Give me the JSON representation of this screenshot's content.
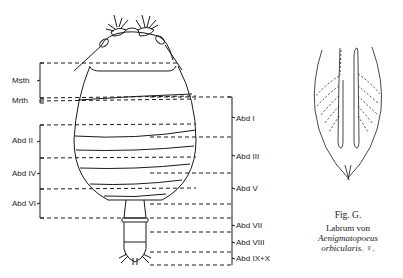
{
  "figure": {
    "left_labels": [
      {
        "id": "msth",
        "label": "Msth"
      },
      {
        "id": "mrth",
        "label": "Mrth"
      },
      {
        "id": "abd2",
        "label": "Abd II"
      },
      {
        "id": "abd4",
        "label": "Abd IV"
      },
      {
        "id": "abd6",
        "label": "Abd VI"
      }
    ],
    "right_labels": [
      {
        "id": "abd1",
        "label": "Abd I"
      },
      {
        "id": "abd3",
        "label": "Abd III"
      },
      {
        "id": "abd5",
        "label": "Abd V"
      },
      {
        "id": "abd7",
        "label": "Abd VII"
      },
      {
        "id": "abd8",
        "label": "Abd VIII"
      },
      {
        "id": "abd9",
        "label": "Abd IX+X"
      }
    ],
    "caption": {
      "fig": "Fig. G.",
      "line1": "Labrum von",
      "species": "Aenigmatopoeus",
      "epithet": "orbicularis.",
      "sex": "♀."
    }
  },
  "colors": {
    "ink": "#1a1a1a",
    "paper": "#ffffff"
  }
}
